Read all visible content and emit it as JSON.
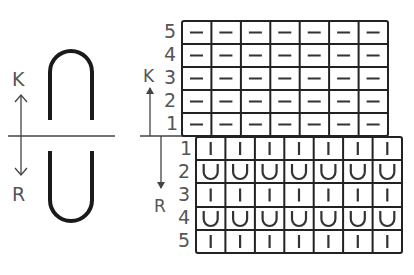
{
  "legend": {
    "knit_label": "K",
    "reverse_label": "R"
  },
  "upper_chart": {
    "direction_label": "K",
    "rows": [
      "1",
      "2",
      "3",
      "4",
      "5"
    ],
    "columns": 7,
    "symbol": "—",
    "symbol_name": "purl-dash"
  },
  "lower_chart": {
    "direction_label": "R",
    "rows": [
      "1",
      "2",
      "3",
      "4",
      "5"
    ],
    "columns": 7,
    "row_symbols": [
      "|",
      "U",
      "|",
      "U",
      "|"
    ]
  },
  "colors": {
    "line": "#222222",
    "label": "#555555",
    "background": "#ffffff"
  }
}
